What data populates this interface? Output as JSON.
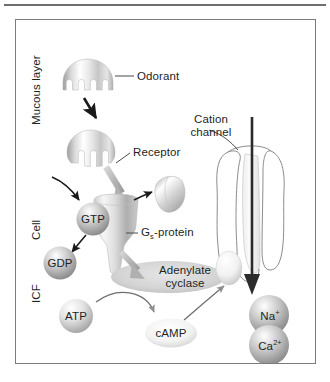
{
  "figure": {
    "background_color": "#ffffff",
    "border_color": "#7a7c7e",
    "text_color": "#221f1f"
  },
  "compartment_labels": [
    {
      "name": "mucous-layer",
      "text": "Mucous layer"
    },
    {
      "name": "cell",
      "text": "Cell"
    },
    {
      "name": "icf",
      "text": "ICF"
    }
  ],
  "callouts": [
    {
      "name": "odorant",
      "text": "Odorant",
      "leader": "horizontal"
    },
    {
      "name": "cation-channel",
      "line1": "Cation",
      "line2": "channel",
      "leader": "curved"
    },
    {
      "name": "receptor",
      "text": "Receptor",
      "leader": "diagonal"
    },
    {
      "name": "gs-protein",
      "prefix": "G",
      "subscript": "s",
      "suffix": "-protein",
      "leader": "horizontal"
    }
  ],
  "molecules": [
    {
      "name": "gtp",
      "text": "GTP",
      "shape": "sphere",
      "fill": "#b9b9b9"
    },
    {
      "name": "gdp",
      "text": "GDP",
      "shape": "sphere",
      "fill": "#b9b9b9"
    },
    {
      "name": "atp",
      "text": "ATP",
      "shape": "sphere",
      "fill": "#d3d3d3"
    },
    {
      "name": "camp",
      "text": "cAMP",
      "shape": "ellipse",
      "fill": "#ececec"
    },
    {
      "name": "adenylate-cyclase",
      "line1": "Adenylate",
      "line2": "cyclase",
      "shape": "ellipse",
      "fill": "#d8d8d8"
    },
    {
      "name": "sodium-ion",
      "symbol": "Na",
      "charge": "+",
      "shape": "sphere",
      "fill": "#c2c2c2"
    },
    {
      "name": "calcium-ion",
      "symbol": "Ca",
      "charge": "2+",
      "shape": "sphere",
      "fill": "#bdbdbd"
    }
  ],
  "structures": [
    {
      "name": "odorant-molecule",
      "description": "dome with four finger projections"
    },
    {
      "name": "receptor-protein",
      "description": "rounded blob with notches"
    },
    {
      "name": "g-protein-body",
      "description": "funnel shaped subunit"
    },
    {
      "name": "g-protein-subunit",
      "description": "detached lobe"
    },
    {
      "name": "cation-channel-pore",
      "description": "tall two-lobed membrane channel"
    }
  ],
  "arrows": [
    {
      "name": "odorant-to-receptor",
      "style": "black-solid"
    },
    {
      "name": "receptor-to-gprotein",
      "style": "gray-thick"
    },
    {
      "name": "gtp-binding",
      "style": "black-thin-curved"
    },
    {
      "name": "gtp-to-gdp",
      "style": "black-thin-curved"
    },
    {
      "name": "subunit-release",
      "style": "black-thin-curved"
    },
    {
      "name": "gprotein-to-cyclase",
      "style": "gray-thick"
    },
    {
      "name": "atp-to-camp",
      "style": "gray-thin-curved"
    },
    {
      "name": "camp-to-channel",
      "style": "gray-thin-curved"
    },
    {
      "name": "ion-influx",
      "style": "black-thick-vertical"
    }
  ]
}
